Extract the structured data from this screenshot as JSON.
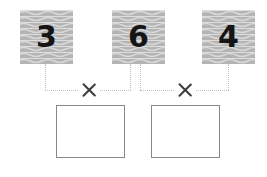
{
  "worksheet": {
    "type": "multiplication-worksheet",
    "width": 267,
    "height": 177,
    "background_color": "#ffffff"
  },
  "tiles": [
    {
      "id": "tile-1",
      "value": "3",
      "texture": "wavy-gray",
      "fill_color": "#b4b4b4",
      "text_color": "#151515"
    },
    {
      "id": "tile-2",
      "value": "6",
      "texture": "wavy-gray",
      "fill_color": "#b4b4b4",
      "text_color": "#151515"
    },
    {
      "id": "tile-3",
      "value": "4",
      "texture": "wavy-gray",
      "fill_color": "#b4b4b4",
      "text_color": "#151515"
    }
  ],
  "operators": [
    {
      "id": "times-1",
      "symbol": "×",
      "name": "multiplication-sign",
      "color": "#3c3c3c"
    },
    {
      "id": "times-2",
      "symbol": "×",
      "name": "multiplication-sign",
      "color": "#3c3c3c"
    }
  ],
  "connectors": {
    "color": "#c0c0c0",
    "style": "dotted",
    "description": "dotted lines joining tiles to operators and answer boxes"
  },
  "answer_boxes": [
    {
      "id": "answer-1",
      "value": "",
      "placeholder": "",
      "border_color": "#888888"
    },
    {
      "id": "answer-2",
      "value": "",
      "placeholder": "",
      "border_color": "#888888"
    }
  ],
  "expressions": [
    {
      "left": "3",
      "operator": "×",
      "right": "6",
      "answer": ""
    },
    {
      "left": "6",
      "operator": "×",
      "right": "4",
      "answer": ""
    }
  ]
}
